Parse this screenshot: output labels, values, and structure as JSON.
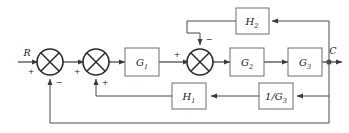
{
  "diagram": {
    "type": "block-diagram",
    "signals": {
      "input": "R",
      "output": "C"
    },
    "blocks": [
      {
        "id": "G1",
        "label": "G",
        "subscript": "1",
        "full": "G1"
      },
      {
        "id": "G2",
        "label": "G",
        "subscript": "2",
        "full": "G2"
      },
      {
        "id": "G3",
        "label": "G",
        "subscript": "3",
        "full": "G3"
      },
      {
        "id": "H1",
        "label": "H",
        "subscript": "1",
        "full": "H1"
      },
      {
        "id": "H2",
        "label": "H",
        "subscript": "2",
        "full": "H2"
      },
      {
        "id": "invG3",
        "label": "1/G",
        "subscript": "3",
        "full": "1/G3"
      }
    ],
    "summing_junctions": [
      {
        "id": "sum1",
        "signs": {
          "input_left": "+",
          "input_bottom": "−"
        }
      },
      {
        "id": "sum2",
        "signs": {
          "input_left": "+",
          "input_bottom": "+"
        }
      },
      {
        "id": "sum3",
        "signs": {
          "input_left": "+",
          "input_top": "−"
        }
      }
    ],
    "signs": {
      "plus": "+",
      "minus": "−"
    },
    "colors": {
      "wire": "#4a4a4a",
      "box_stroke": "#6e6e6e",
      "summer_stroke": "#2b2b2b",
      "text": "#1a1a1a",
      "background": "#ffffff"
    }
  }
}
